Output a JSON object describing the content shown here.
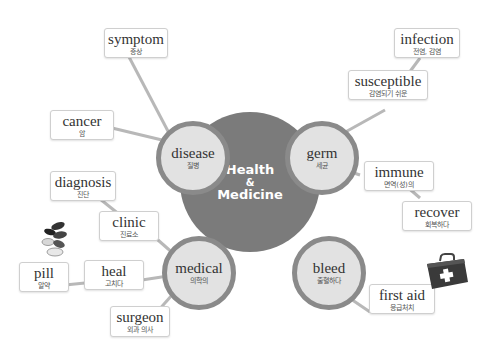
{
  "center": {
    "line1": "Health",
    "line2": "&",
    "line3": "Medicine"
  },
  "subtopics": {
    "disease": {
      "en": "disease",
      "ko": "질병"
    },
    "germ": {
      "en": "germ",
      "ko": "세균"
    },
    "medical": {
      "en": "medical",
      "ko": "의학의"
    },
    "bleed": {
      "en": "bleed",
      "ko": "출혈하다"
    }
  },
  "words": {
    "symptom": {
      "en": "symptom",
      "ko": "증상"
    },
    "cancer": {
      "en": "cancer",
      "ko": "암"
    },
    "infection": {
      "en": "infection",
      "ko": "전염, 감염"
    },
    "susceptible": {
      "en": "susceptible",
      "ko": "감염되기 쉬운"
    },
    "immune": {
      "en": "immune",
      "ko": "면역(성)의"
    },
    "recover": {
      "en": "recover",
      "ko": "회복하다"
    },
    "diagnosis": {
      "en": "diagnosis",
      "ko": "진단"
    },
    "clinic": {
      "en": "clinic",
      "ko": "진료소"
    },
    "pill": {
      "en": "pill",
      "ko": "알약"
    },
    "heal": {
      "en": "heal",
      "ko": "고치다"
    },
    "surgeon": {
      "en": "surgeon",
      "ko": "외과 의사"
    },
    "first_aid": {
      "en": "first aid",
      "ko": "응급처치"
    }
  },
  "colors": {
    "center": "#7b7b7b",
    "ring": "#8a8a8a",
    "fill": "#e2e2e2",
    "line": "#b5b5b5"
  }
}
